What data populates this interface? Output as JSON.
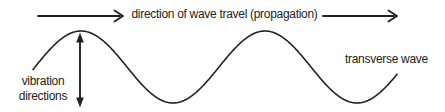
{
  "labels": {
    "propagation": "direction of wave travel (propagation)",
    "vibration_line1": "vibration",
    "vibration_line2": "directions",
    "wave_type": "transverse wave"
  },
  "colors": {
    "ink": "#222222",
    "background": "#ffffff"
  },
  "wave": {
    "start_x": 33,
    "end_x": 397,
    "midline_y": 67,
    "amplitude": 36,
    "wavelength": 184,
    "crest1_x": 81
  }
}
